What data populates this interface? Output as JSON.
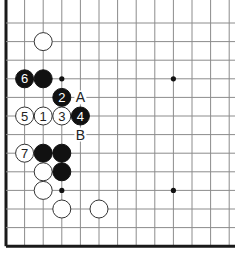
{
  "diagram": {
    "grid": {
      "x0": 6,
      "y0": 23,
      "spacing": 18.6,
      "cols": 13,
      "rows": 13,
      "left_edge": true,
      "bottom_edge": true,
      "top_edge": false,
      "right_edge": false,
      "line_color": "#8c8c8c",
      "edge_color": "#1a1a1a"
    },
    "star_points": [
      {
        "col": 3,
        "row": 3
      },
      {
        "col": 9,
        "row": 3
      },
      {
        "col": 3,
        "row": 9
      },
      {
        "col": 9,
        "row": 9
      }
    ],
    "stones": [
      {
        "col": 2,
        "row": 1,
        "color": "white",
        "label": ""
      },
      {
        "col": 1,
        "row": 3,
        "color": "black",
        "label": "6"
      },
      {
        "col": 2,
        "row": 3,
        "color": "black",
        "label": ""
      },
      {
        "col": 3,
        "row": 4,
        "color": "black",
        "label": "2"
      },
      {
        "col": 1,
        "row": 5,
        "color": "white",
        "label": "5"
      },
      {
        "col": 2,
        "row": 5,
        "color": "white",
        "label": "1"
      },
      {
        "col": 3,
        "row": 5,
        "color": "white",
        "label": "3"
      },
      {
        "col": 4,
        "row": 5,
        "color": "black",
        "label": "4"
      },
      {
        "col": 1,
        "row": 7,
        "color": "white",
        "label": "7"
      },
      {
        "col": 2,
        "row": 7,
        "color": "black",
        "label": ""
      },
      {
        "col": 3,
        "row": 7,
        "color": "black",
        "label": ""
      },
      {
        "col": 2,
        "row": 8,
        "color": "white",
        "label": ""
      },
      {
        "col": 3,
        "row": 8,
        "color": "black",
        "label": ""
      },
      {
        "col": 2,
        "row": 9,
        "color": "white",
        "label": ""
      },
      {
        "col": 3,
        "row": 10,
        "color": "white",
        "label": ""
      },
      {
        "col": 5,
        "row": 10,
        "color": "white",
        "label": ""
      }
    ],
    "markers": [
      {
        "col": 4,
        "row": 4,
        "label": "A"
      },
      {
        "col": 4,
        "row": 6,
        "label": "B"
      }
    ],
    "colors": {
      "black_stone": "#111111",
      "white_stone": "#ffffff",
      "stone_outline": "#333333",
      "black_label": "#ffffff",
      "white_label": "#222222",
      "marker_text": "#222222"
    }
  }
}
